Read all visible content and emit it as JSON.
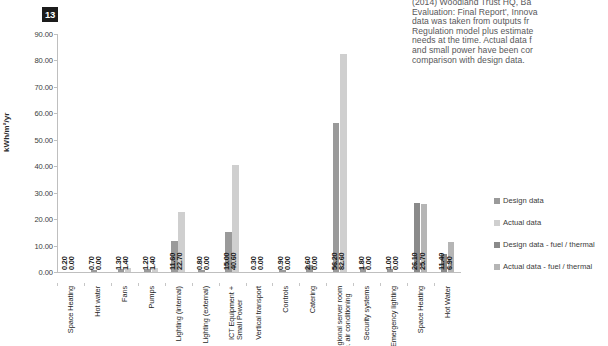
{
  "figure": {
    "badge_number": "13"
  },
  "document_text": {
    "body": "(2014) Woodland Trust HQ, Ba\nEvaluation: Final Report', Innova\ndata was taken from outputs fr\nRegulation model plus estimate\nneeds at the time. Actual data f\nand small power have been cor\ncomparison with design data."
  },
  "legend": {
    "position": "right",
    "items": [
      {
        "label": "Design data",
        "color": "#9a9a9a"
      },
      {
        "label": "Actual data",
        "color": "#cfcfcf"
      },
      {
        "label": "Design data - fuel / thermal",
        "color": "#8a8a8a"
      },
      {
        "label": "Actual data - fuel / thermal",
        "color": "#b5b5b5"
      }
    ]
  },
  "chart_data": {
    "type": "bar",
    "title": "",
    "xlabel": "",
    "ylabel": "kWh/m²/yr",
    "ylim": [
      0,
      90
    ],
    "ytick_labels": [
      "0.00",
      "10.00",
      "20.00",
      "30.00",
      "40.00",
      "50.00",
      "60.00",
      "70.00",
      "80.00",
      "90.00"
    ],
    "ytick_values": [
      0,
      10,
      20,
      30,
      40,
      50,
      60,
      70,
      80,
      90
    ],
    "grid": false,
    "categories": [
      "Space Heating",
      "Hot water",
      "Fans",
      "Pumps",
      "Lighting (internal)",
      "Lighting (external)",
      "ICT Equipment +\nSmall Power",
      "Vertical transport",
      "Controls",
      "Catering",
      "Regional server room\ninc. air conditioning",
      "Security systems",
      "Emergency lighting",
      "Space Heating",
      "Hot Water"
    ],
    "series": [
      {
        "name": "Design data",
        "color": "#9a9a9a",
        "values": [
          0.2,
          0.7,
          1.3,
          1.2,
          11.6,
          0.8,
          15.0,
          0.3,
          0.9,
          2.6,
          56.2,
          1.8,
          1.0,
          null,
          null
        ]
      },
      {
        "name": "Actual data",
        "color": "#cfcfcf",
        "values": [
          0.0,
          0.0,
          1.4,
          1.4,
          22.7,
          0.0,
          40.6,
          0.0,
          0.0,
          0.0,
          82.6,
          0.0,
          0.0,
          null,
          null
        ]
      },
      {
        "name": "Design data - fuel / thermal",
        "color": "#8a8a8a",
        "values": [
          null,
          null,
          null,
          null,
          null,
          null,
          null,
          null,
          null,
          null,
          null,
          null,
          null,
          26.1,
          6.9
        ]
      },
      {
        "name": "Actual data - fuel / thermal",
        "color": "#b5b5b5",
        "values": [
          null,
          null,
          null,
          null,
          null,
          null,
          null,
          null,
          null,
          null,
          null,
          null,
          null,
          25.7,
          11.4
        ]
      }
    ],
    "data_labels": [
      {
        "category": "Space Heating",
        "first": "0.20",
        "second": "0.00"
      },
      {
        "category": "Hot water",
        "first": "0.70",
        "second": "0.00"
      },
      {
        "category": "Fans",
        "first": "1.30",
        "second": "1.40"
      },
      {
        "category": "Pumps",
        "first": "1.20",
        "second": "1.40"
      },
      {
        "category": "Lighting (internal)",
        "first": "11.60",
        "second": "22.70"
      },
      {
        "category": "Lighting (external)",
        "first": "0.80",
        "second": "0.00"
      },
      {
        "category": "ICT Equipment + Small Power",
        "first": "15.00",
        "second": "40.60"
      },
      {
        "category": "Vertical transport",
        "first": "0.30",
        "second": "0.00"
      },
      {
        "category": "Controls",
        "first": "0.90",
        "second": "0.00"
      },
      {
        "category": "Catering",
        "first": "2.60",
        "second": "0.00"
      },
      {
        "category": "Regional server room inc. air conditioning",
        "first": "56.20",
        "second": "82.60"
      },
      {
        "category": "Security systems",
        "first": "1.80",
        "second": "0.00"
      },
      {
        "category": "Emergency lighting",
        "first": "1.00",
        "second": "0.00"
      },
      {
        "category": "Space Heating",
        "first": "26.10",
        "second": "25.70"
      },
      {
        "category": "Hot Water",
        "first": "11.40",
        "second": "6.90"
      }
    ]
  }
}
